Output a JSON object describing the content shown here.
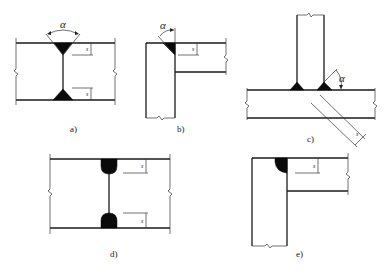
{
  "figure": {
    "colors": {
      "line": "#1a1a1a",
      "weld_fill": "#0a0a0a",
      "background": "#ffffff"
    }
  },
  "panels": [
    {
      "id": "a",
      "label": "a)",
      "type": "double-V butt weld",
      "angle_symbol": "α",
      "dim_labels": [
        "s",
        "s"
      ]
    },
    {
      "id": "b",
      "label": "b)",
      "type": "single-bevel corner weld",
      "angle_symbol": "α",
      "dim_labels": [
        "s"
      ]
    },
    {
      "id": "c",
      "label": "c)",
      "type": "T-joint double fillet weld",
      "angle_symbol": "α",
      "dim_labels": [
        "s"
      ]
    },
    {
      "id": "d",
      "label": "d)",
      "type": "double-sided butt weld (rounded)",
      "dim_labels": [
        "s",
        "s"
      ]
    },
    {
      "id": "e",
      "label": "e)",
      "type": "corner weld (rounded)",
      "dim_labels": [
        "s"
      ]
    }
  ]
}
